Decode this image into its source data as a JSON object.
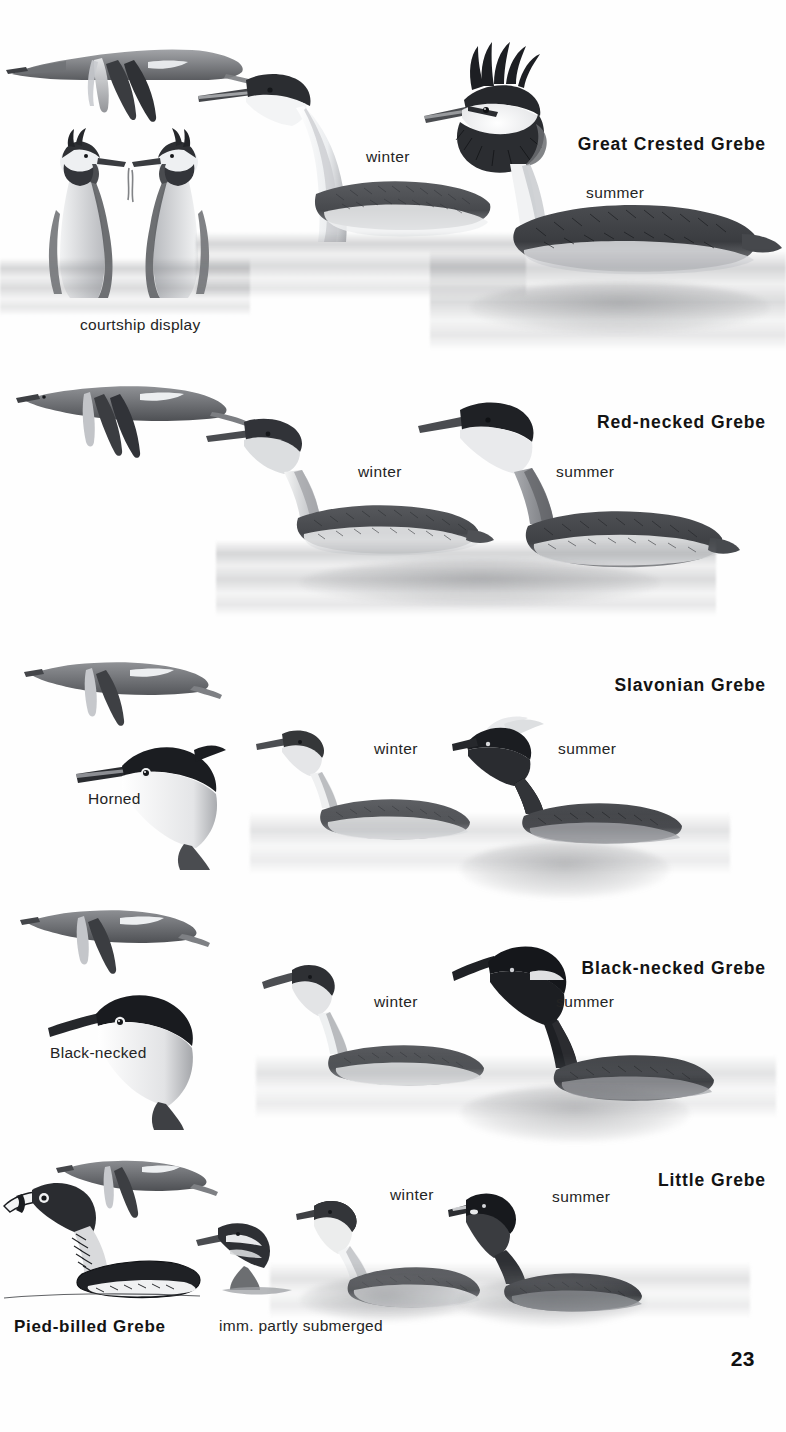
{
  "page": {
    "number": "23",
    "kind": "field-guide-plate",
    "palette": {
      "ink": "#131313",
      "wash": "#7a7c80",
      "paper": "#fefefe"
    }
  },
  "entries": [
    {
      "id": "great-crested-grebe",
      "title": "Great Crested Grebe",
      "labels": {
        "winter": "winter",
        "summer": "summer",
        "extra": "courtship display"
      }
    },
    {
      "id": "red-necked-grebe",
      "title": "Red-necked Grebe",
      "labels": {
        "winter": "winter",
        "summer": "summer"
      }
    },
    {
      "id": "slavonian-grebe",
      "title": "Slavonian Grebe",
      "labels": {
        "winter": "winter",
        "summer": "summer",
        "extra": "Horned"
      }
    },
    {
      "id": "black-necked-grebe",
      "title": "Black-necked Grebe",
      "labels": {
        "winter": "winter",
        "summer": "summer",
        "extra": "Black-necked"
      }
    },
    {
      "id": "little-grebe",
      "title": "Little Grebe",
      "labels": {
        "winter": "winter",
        "summer": "summer"
      }
    },
    {
      "id": "pied-billed-grebe",
      "title": "Pied-billed Grebe",
      "labels": {
        "extra": "imm. partly submerged"
      }
    }
  ]
}
